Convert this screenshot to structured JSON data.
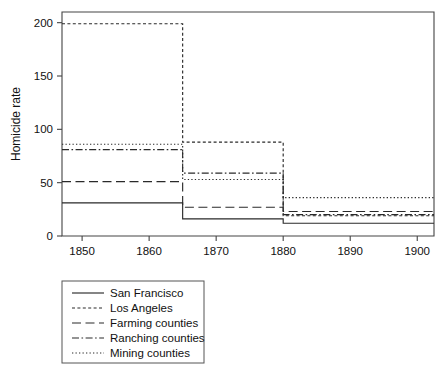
{
  "chart_data": {
    "type": "line",
    "title": "",
    "subtitle": "",
    "xlabel": "",
    "ylabel": "Homicide rate",
    "xlim": [
      1847,
      1902.5
    ],
    "ylim": [
      0,
      210
    ],
    "grid": false,
    "legend_position": "below-left",
    "xticks": [
      1850,
      1860,
      1870,
      1880,
      1890,
      1900
    ],
    "xtick_labels": [
      "1850",
      "1860",
      "1870",
      "1880",
      "1890",
      "1900"
    ],
    "yticks": [
      0,
      50,
      100,
      150,
      200
    ],
    "ytick_labels": [
      "0",
      "50",
      "100",
      "150",
      "200"
    ],
    "step_style": "post",
    "x_breaks": [
      1847,
      1865,
      1880,
      1902.5
    ],
    "periods": [
      "1847-1865",
      "1865-1880",
      "1880-1900"
    ],
    "series": [
      {
        "name": "San Francisco",
        "dash": "solid",
        "color": "#2a2a2a",
        "values": [
          31,
          16,
          12
        ]
      },
      {
        "name": "Los Angeles",
        "dash": "dashed-short",
        "color": "#2a2a2a",
        "values": [
          199,
          88,
          19
        ]
      },
      {
        "name": "Farming counties",
        "dash": "dashed-long",
        "color": "#2a2a2a",
        "values": [
          51,
          27,
          23
        ]
      },
      {
        "name": "Ranching counties",
        "dash": "dash-dot",
        "color": "#2a2a2a",
        "values": [
          81,
          59,
          20
        ]
      },
      {
        "name": "Mining counties",
        "dash": "dotted",
        "color": "#2a2a2a",
        "values": [
          86,
          53,
          36
        ]
      }
    ]
  },
  "legend": {
    "items": [
      {
        "label": "San Francisco"
      },
      {
        "label": "Los Angeles"
      },
      {
        "label": "Farming counties"
      },
      {
        "label": "Ranching counties"
      },
      {
        "label": "Mining counties"
      }
    ]
  },
  "axes": {
    "ylabel": "Homicide rate",
    "xtick_labels": [
      "1850",
      "1860",
      "1870",
      "1880",
      "1890",
      "1900"
    ],
    "ytick_labels": [
      "0",
      "50",
      "100",
      "150",
      "200"
    ]
  },
  "colors": {
    "ink": "#2a2a2a",
    "axis": "#444444",
    "background": "#ffffff"
  }
}
